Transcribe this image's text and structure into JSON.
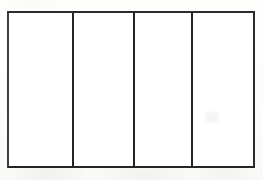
{
  "figure": {
    "name": "four-panel-rectangle-diagram",
    "title": "",
    "background_color": "#fdfdfc",
    "panel_fill_color": "#ffffff",
    "stroke_color": "#242424",
    "stroke_width_px": 2,
    "frame": {
      "left_px": 7,
      "top_px": 11,
      "width_px": 248,
      "height_px": 157
    },
    "divider_x_positions_px": [
      71,
      133,
      192
    ],
    "panel_count": 4,
    "panels": [
      {
        "index": 1,
        "label": "",
        "width_px": 64,
        "content": ""
      },
      {
        "index": 2,
        "label": "",
        "width_px": 62,
        "content": ""
      },
      {
        "index": 3,
        "label": "",
        "width_px": 59,
        "content": ""
      },
      {
        "index": 4,
        "label": "",
        "width_px": 63,
        "content": ""
      }
    ]
  }
}
